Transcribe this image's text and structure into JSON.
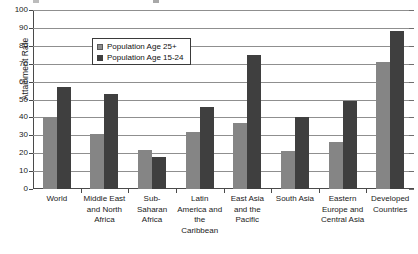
{
  "chart_data": {
    "type": "bar",
    "title": "",
    "xlabel": "",
    "ylabel": "Attainment Rate",
    "ylim": [
      0,
      100
    ],
    "ytick_step": 10,
    "ytick_labels": [
      "0",
      "10",
      "20",
      "30",
      "40",
      "50",
      "60",
      "70",
      "80",
      "90",
      "100"
    ],
    "grid": "horizontal",
    "legend_position": "inside-top-center",
    "categories": [
      "World",
      "Middle East and North Africa",
      "Sub-Saharan Africa",
      "Latin America and the Caribbean",
      "East Asia and the Pacific",
      "South Asia",
      "Eastern Europe and Central Asia",
      "Developed Countries"
    ],
    "category_lines": [
      [
        "World"
      ],
      [
        "Middle East",
        "and North",
        "Africa"
      ],
      [
        "Sub-",
        "Saharan",
        "Africa"
      ],
      [
        "Latin",
        "America and",
        "the",
        "Caribbean"
      ],
      [
        "East Asia",
        "and the",
        "Pacific"
      ],
      [
        "South Asia"
      ],
      [
        "Eastern",
        "Europe and",
        "Central Asia"
      ],
      [
        "Developed",
        "Countries"
      ]
    ],
    "series": [
      {
        "name": "Population Age 25+",
        "color": "#858585",
        "values": [
          40,
          31,
          22,
          32,
          37,
          21,
          26,
          71
        ]
      },
      {
        "name": "Population Age 15-24",
        "color": "#3f3f3f",
        "values": [
          57,
          53,
          18,
          46,
          75,
          40,
          49,
          88
        ]
      }
    ]
  },
  "legend": {
    "items": [
      {
        "label": "Population Age 25+"
      },
      {
        "label": "Population Age 15-24"
      }
    ]
  },
  "axes": {
    "y_title": "Attainment Rate"
  }
}
